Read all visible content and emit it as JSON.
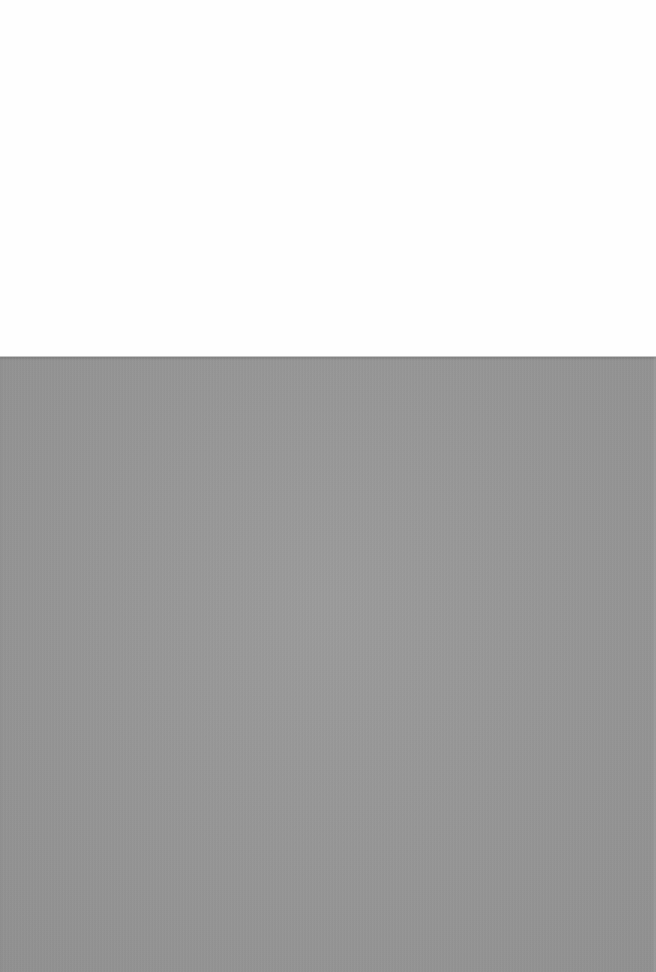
{
  "scene": {
    "description": "Photograph of a plain gray textured surface below a white background",
    "colors": {
      "background": "#fefefe",
      "surface": "#959595"
    }
  }
}
